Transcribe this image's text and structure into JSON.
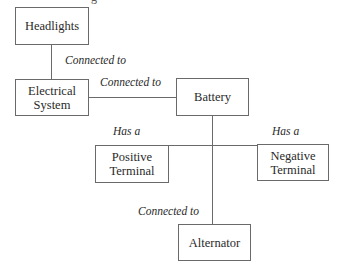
{
  "caption_fragment": "g",
  "nodes": {
    "headlights": "Headlights",
    "electrical_system": "Electrical\nSystem",
    "battery": "Battery",
    "positive_terminal": "Positive\nTerminal",
    "negative_terminal": "Negative\nTerminal",
    "alternator": "Alternator"
  },
  "edges": [
    {
      "from": "Headlights",
      "to": "Electrical System",
      "label": "Connected to"
    },
    {
      "from": "Electrical System",
      "to": "Battery",
      "label": "Connected to"
    },
    {
      "from": "Battery",
      "to": "Positive Terminal",
      "label": "Has a"
    },
    {
      "from": "Battery",
      "to": "Negative Terminal",
      "label": "Has a"
    },
    {
      "from": "Battery",
      "to": "Alternator",
      "label": "Connected to"
    }
  ],
  "colors": {
    "line": "#6a6a6a",
    "text": "#2a2a2a",
    "background": "#ffffff"
  }
}
